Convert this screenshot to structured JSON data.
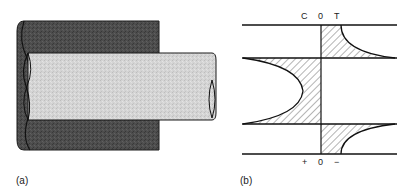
{
  "figure": {
    "panel_a": {
      "label": "(a)",
      "description": "Shaft (rod) fitted inside a tube/hub"
    },
    "panel_b": {
      "label": "(b)",
      "top_axis": {
        "left": "C",
        "center": "0",
        "right": "T"
      },
      "bottom_axis": {
        "left": "+",
        "center": "0",
        "right": "−"
      },
      "description": "Stress distribution along the fit"
    },
    "colors": {
      "tube": "#4a4a4a",
      "rod": "#d6d6d6",
      "line": "#1a1a1a",
      "hatch": "#333333"
    }
  }
}
